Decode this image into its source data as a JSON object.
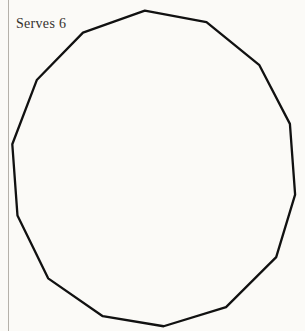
{
  "page": {
    "width": 305,
    "height": 331,
    "background_color": "#fbfaf7",
    "ink_color": "#111111",
    "margin_rule_color": "#b5b1aa",
    "clipped_header_text": "..."
  },
  "caption": {
    "serves_label": "Serves 6"
  },
  "illustration": {
    "title": "Plated grain dish with radial garnish",
    "medium": "pen-and-ink line drawing",
    "plate": {
      "shape": "polygon",
      "sides": 14,
      "center_x": 155,
      "center_y": 170,
      "radius_x": 143,
      "radius_y": 158,
      "rotation_deg": -4,
      "stroke_width": 2.3,
      "hatch_count": 150,
      "hatch_length": 11,
      "hatch_stroke_width": 1.7,
      "spoke_count": 14,
      "spoke_inner_radius_ratio": 0.66,
      "spoke_outer_radius_ratio": 0.84,
      "spoke_stroke_width": 1.9
    },
    "grain_bed": {
      "shape": "circle",
      "center_x": 160,
      "center_y": 172,
      "radius_x": 115,
      "radius_y": 110,
      "stroke_width": 2.1,
      "grain_count": 1050,
      "grain_shape": "oval",
      "grain_min_length": 2.2,
      "grain_max_length": 6.0,
      "density_gradient": "dense-at-center"
    },
    "garnish": {
      "shape": "radially-striated disc",
      "center_x": 163,
      "center_y": 157,
      "radius_x": 38,
      "radius_y": 40,
      "stroke_width": 2.0,
      "ray_count": 116,
      "ray_stroke_width": 1.3,
      "description": "sliced tomato or onion rosette"
    }
  }
}
